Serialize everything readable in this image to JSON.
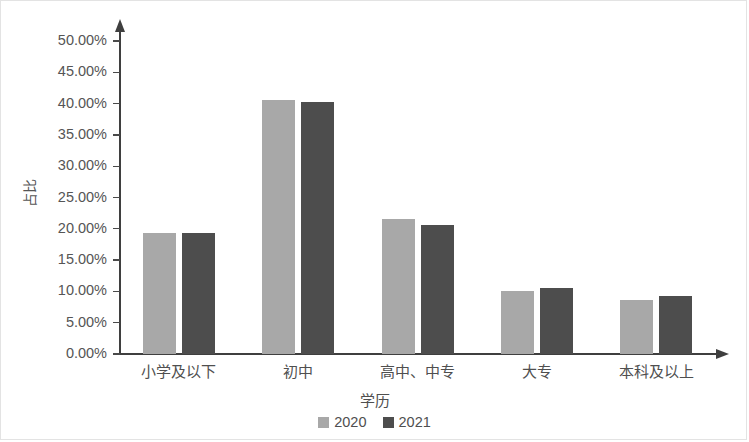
{
  "chart_data": {
    "type": "bar",
    "title": "",
    "subtitle": "",
    "xlabel": "学历",
    "ylabel": "占比",
    "categories": [
      "小学及以下",
      "初中",
      "高中、中专",
      "大专",
      "本科及以上"
    ],
    "series": [
      {
        "name": "2020",
        "color": "#a8a8a8",
        "values": [
          19.3,
          40.5,
          21.5,
          10.0,
          8.6
        ]
      },
      {
        "name": "2021",
        "color": "#4d4d4d",
        "values": [
          19.3,
          40.3,
          20.6,
          10.5,
          9.2
        ]
      }
    ],
    "ylim": [
      0,
      50
    ],
    "y_tick_step": 5,
    "y_tick_labels": [
      "0.00%",
      "5.00%",
      "10.00%",
      "15.00%",
      "20.00%",
      "25.00%",
      "30.00%",
      "35.00%",
      "40.00%",
      "45.00%",
      "50.00%"
    ],
    "y_tick_values": [
      0,
      5,
      10,
      15,
      20,
      25,
      30,
      35,
      40,
      45,
      50
    ],
    "value_unit": "%",
    "grid": false,
    "legend_position": "bottom-center",
    "legend_entries": [
      "2020",
      "2021"
    ],
    "axis_color": "#3f3f3f",
    "text_color": "#4f4f4f",
    "background": "#ffffff",
    "border_color": "#e3e3e3"
  }
}
